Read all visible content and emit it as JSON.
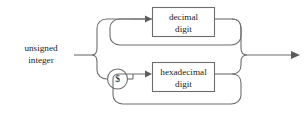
{
  "diagram": {
    "kind": "syntax-railroad-diagram",
    "title": "unsigned integer",
    "background_color": "#ffffff",
    "line_color": "#6e6e6e",
    "text_color": "#1c1c1c",
    "entry": {
      "name": "unsigned-integer",
      "label_line1": "unsigned",
      "label_line2": "integer"
    },
    "branches": [
      {
        "id": "decimal-branch",
        "token": null,
        "box_line1": "decimal",
        "box_line2": "digit",
        "repeatable": true
      },
      {
        "id": "hexadecimal-branch",
        "token": "$",
        "box_line1": "hexadecimal",
        "box_line2": "digit",
        "repeatable": true
      }
    ],
    "terminal_token": {
      "name": "dollar-sign",
      "symbol": "$"
    },
    "exit": {
      "name": "exit-arrow",
      "label": ""
    }
  }
}
